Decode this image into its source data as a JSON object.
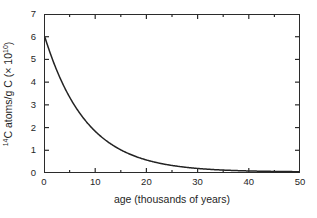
{
  "chart_data": {
    "type": "line",
    "title": "",
    "xlabel": "age (thousands of years)",
    "ylabel_parts": {
      "isotope_superscript": "14",
      "isotope_rest": "C atoms/g C (× 10",
      "exponent": "10",
      "close": ")"
    },
    "ylabel_plain": "14C atoms/g C (× 10^10)",
    "xlim": [
      0,
      50
    ],
    "ylim": [
      0,
      7
    ],
    "xticks": [
      0,
      10,
      20,
      30,
      40,
      50
    ],
    "xticklabels": [
      "0",
      "10",
      "20",
      "30",
      "40",
      "50"
    ],
    "xminorticks": [
      5,
      15,
      25,
      35,
      45
    ],
    "yticks": [
      0,
      1,
      2,
      3,
      4,
      5,
      6,
      7
    ],
    "yticklabels": [
      "0",
      "1",
      "2",
      "3",
      "4",
      "5",
      "6",
      "7"
    ],
    "grid": false,
    "legend": null,
    "series": [
      {
        "name": "14C decay",
        "initial_value": 6.0,
        "half_life_kyr": 5.73,
        "line_color": "#232323",
        "line_width": 1.4,
        "x": [
          0,
          1,
          2,
          3,
          4,
          5,
          6,
          7,
          8,
          9,
          10,
          11,
          12,
          13,
          14,
          15,
          16,
          17,
          18,
          19,
          20,
          22,
          24,
          26,
          28,
          30,
          32,
          34,
          36,
          38,
          40,
          42,
          44,
          46,
          48,
          50
        ],
        "y": [
          6.0,
          5.31,
          4.7,
          4.16,
          3.68,
          3.26,
          2.88,
          2.55,
          2.26,
          2.0,
          1.77,
          1.57,
          1.39,
          1.23,
          1.09,
          0.96,
          0.85,
          0.75,
          0.67,
          0.59,
          0.52,
          0.41,
          0.32,
          0.25,
          0.2,
          0.16,
          0.12,
          0.1,
          0.08,
          0.06,
          0.05,
          0.04,
          0.03,
          0.02,
          0.02,
          0.01
        ]
      }
    ]
  },
  "axes": {
    "frame_color": "#2b2b2b",
    "tick_color": "#2b2b2b",
    "background": "#ffffff"
  }
}
